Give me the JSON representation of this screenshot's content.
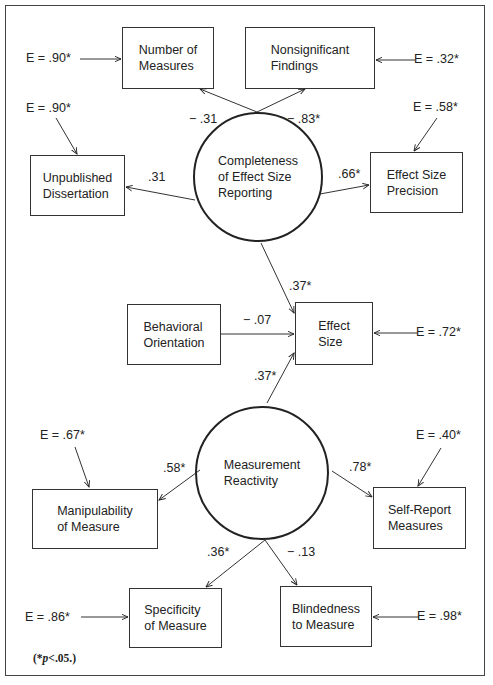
{
  "figure": {
    "latent_factors": [
      {
        "id": "completeness",
        "label": "Completeness\nof Effect Size\nReporting"
      },
      {
        "id": "reactivity",
        "label": "Measurement\nReactivity"
      }
    ],
    "observed_variables": [
      {
        "id": "number_of_measures",
        "label": "Number of\nMeasures",
        "error": "E  =  .90*"
      },
      {
        "id": "nonsignificant_findings",
        "label": "Nonsignificant\nFindings",
        "error": "E  =  .32*"
      },
      {
        "id": "unpublished_dissertation",
        "label": "Unpublished\nDissertation",
        "error": "E  =  .90*"
      },
      {
        "id": "effect_size_precision",
        "label": "Effect Size\nPrecision",
        "error": "E  =  .58*"
      },
      {
        "id": "behavioral_orientation",
        "label": "Behavioral\nOrientation"
      },
      {
        "id": "effect_size",
        "label": "Effect\nSize",
        "error": "E  =  .72*"
      },
      {
        "id": "manipulability",
        "label": "Manipulability\nof Measure",
        "error": "E  =  .67*"
      },
      {
        "id": "self_report",
        "label": "Self-Report\nMeasures",
        "error": "E  =  .40*"
      },
      {
        "id": "specificity",
        "label": "Specificity\nof Measure",
        "error": "E  =  .86*"
      },
      {
        "id": "blindedness",
        "label": "Blindedness\nto Measure",
        "error": "E  =  .98*"
      }
    ],
    "paths": [
      {
        "from": "completeness",
        "to": "number_of_measures",
        "coef": "− .31"
      },
      {
        "from": "completeness",
        "to": "nonsignificant_findings",
        "coef": "− .83*"
      },
      {
        "from": "completeness",
        "to": "unpublished_dissertation",
        "coef": ".31"
      },
      {
        "from": "completeness",
        "to": "effect_size_precision",
        "coef": ".66*"
      },
      {
        "from": "completeness",
        "to": "effect_size",
        "coef": ".37*"
      },
      {
        "from": "behavioral_orientation",
        "to": "effect_size",
        "coef": "− .07"
      },
      {
        "from": "reactivity",
        "to": "effect_size",
        "coef": ".37*"
      },
      {
        "from": "reactivity",
        "to": "manipulability",
        "coef": ".58*"
      },
      {
        "from": "reactivity",
        "to": "self_report",
        "coef": ".78*"
      },
      {
        "from": "reactivity",
        "to": "specificity",
        "coef": ".36*"
      },
      {
        "from": "reactivity",
        "to": "blindedness",
        "coef": "− .13"
      }
    ],
    "note": {
      "prefix": "(*",
      "p": "p",
      "suffix": "<.05.)"
    }
  }
}
